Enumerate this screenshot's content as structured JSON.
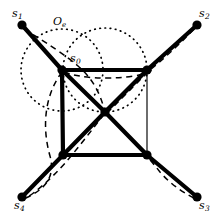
{
  "figure": {
    "caption_label": "Oe",
    "background_color": "#ffffff",
    "stroke_color": "#000000",
    "width": 223,
    "height": 222
  },
  "labels": {
    "center_region": {
      "text": "O",
      "subscript": "e",
      "x": 53,
      "y": 16
    },
    "nodes": [
      {
        "id": "s0",
        "text": "s",
        "subscript": "0",
        "x": 70,
        "y": 53,
        "node_x": 62,
        "node_y": 70
      },
      {
        "id": "s1",
        "text": "s",
        "subscript": "1",
        "x": 12,
        "y": 8,
        "node_x": 22,
        "node_y": 25
      },
      {
        "id": "s2",
        "text": "s",
        "subscript": "2",
        "x": 199,
        "y": 8,
        "node_x": 197,
        "node_y": 25
      },
      {
        "id": "s3",
        "text": "s",
        "subscript": "3",
        "x": 199,
        "y": 200,
        "node_x": 197,
        "node_y": 197
      },
      {
        "id": "s4",
        "text": "s",
        "subscript": "4",
        "x": 14,
        "y": 200,
        "node_x": 22,
        "node_y": 197
      }
    ]
  },
  "geometry": {
    "square": {
      "top_left": {
        "x": 62,
        "y": 70
      },
      "top_right": {
        "x": 147,
        "y": 70
      },
      "bottom_right": {
        "x": 147,
        "y": 155
      },
      "bottom_left": {
        "x": 63,
        "y": 155
      }
    },
    "center_node": {
      "x": 105,
      "y": 112
    },
    "leaf_nodes": [
      {
        "id": "s1",
        "x": 22,
        "y": 25
      },
      {
        "id": "s2",
        "x": 197,
        "y": 25
      },
      {
        "id": "s3",
        "x": 197,
        "y": 197
      },
      {
        "id": "s4",
        "x": 22,
        "y": 197
      }
    ],
    "thin_edges": [
      {
        "from": [
          62,
          70
        ],
        "to": [
          147,
          70
        ]
      },
      {
        "from": [
          147,
          70
        ],
        "to": [
          147,
          155
        ]
      },
      {
        "from": [
          147,
          155
        ],
        "to": [
          63,
          155
        ]
      },
      {
        "from": [
          63,
          155
        ],
        "to": [
          62,
          70
        ]
      },
      {
        "from": [
          147,
          70
        ],
        "to": [
          105,
          112
        ]
      },
      {
        "from": [
          63,
          155
        ],
        "to": [
          105,
          112
        ]
      }
    ],
    "thick_edges": [
      {
        "from": [
          22,
          25
        ],
        "to": [
          62,
          70
        ]
      },
      {
        "from": [
          62,
          70
        ],
        "to": [
          105,
          112
        ]
      },
      {
        "from": [
          105,
          112
        ],
        "to": [
          147,
          155
        ]
      },
      {
        "from": [
          147,
          155
        ],
        "to": [
          197,
          197
        ]
      },
      {
        "from": [
          197,
          25
        ],
        "to": [
          147,
          70
        ]
      },
      {
        "from": [
          147,
          70
        ],
        "to": [
          105,
          112
        ]
      },
      {
        "from": [
          105,
          112
        ],
        "to": [
          63,
          155
        ]
      },
      {
        "from": [
          63,
          155
        ],
        "to": [
          22,
          197
        ]
      },
      {
        "from": [
          62,
          70
        ],
        "to": [
          147,
          70
        ]
      },
      {
        "from": [
          63,
          155
        ],
        "to": [
          147,
          155
        ]
      },
      {
        "from": [
          62,
          70
        ],
        "to": [
          63,
          155
        ]
      }
    ],
    "dotted_circles": [
      {
        "cx": 62,
        "cy": 70,
        "r": 41
      },
      {
        "cx": 105,
        "cy": 70,
        "r": 42
      }
    ],
    "dashed_paths": [
      "M 24 29 C 52 46 66 56 78 66 C 92 78 100 92 105 112",
      "M 62 72 C 44 96 42 128 50 156 C 56 178 44 190 24 199",
      "M 64 72 C 80 78 106 80 134 76 C 146 74 154 72 150 68",
      "M 194 29 C 176 48 162 60 150 70 C 140 80 128 92 108 112",
      "M 107 114 C 126 134 146 154 160 172 C 172 186 186 194 196 199",
      "M 104 114 C 92 130 78 148 66 162 C 50 180 36 192 26 198"
    ],
    "node_dot_radius": 4.6,
    "center_dot_radius": 4.6,
    "thick_stroke": 4.2,
    "thin_stroke": 1.15,
    "dashed_stroke": 1.5,
    "dotted_stroke": 1.7
  }
}
